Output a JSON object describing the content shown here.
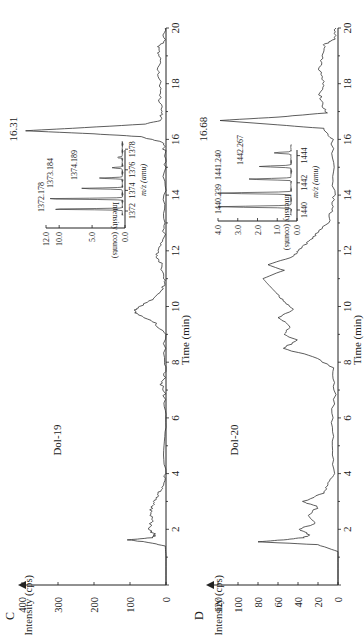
{
  "figure": {
    "orientation": "rotated-90-ccw",
    "panels": [
      {
        "id": "C",
        "panel_label": "C",
        "sample_label": "Dol-19",
        "ylabel": "Intensity (cps)",
        "xlabel": "Time (min)",
        "peak_label": "16.31",
        "y_ticks": [
          "0",
          "100",
          "200",
          "300",
          "400"
        ],
        "x_ticks": [
          "2",
          "4",
          "6",
          "8",
          "10",
          "12",
          "14",
          "16",
          "18",
          "20"
        ],
        "inset": {
          "ylabel": "Intensity (counts)",
          "xlabel": "m/z (amu)",
          "y_ticks": [
            "0.0",
            "5.0",
            "10.0",
            "12.0"
          ],
          "x_ticks": [
            "1372",
            "1374",
            "1376",
            "1378"
          ],
          "peak_labels": [
            "1372.178",
            "1373.184",
            "1374.189"
          ]
        }
      },
      {
        "id": "D",
        "panel_label": "D",
        "sample_label": "Dol-20",
        "ylabel": "Intensity (cps)",
        "xlabel": "Time (min)",
        "peak_label": "16.68",
        "y_ticks": [
          "0",
          "20",
          "40",
          "60",
          "80",
          "100",
          "120"
        ],
        "x_ticks": [
          "2",
          "4",
          "6",
          "8",
          "10",
          "12",
          "14",
          "16",
          "18",
          "20"
        ],
        "inset": {
          "ylabel": "Intensity (counts)",
          "xlabel": "m/z (amu)",
          "y_ticks": [
            "0.0",
            "1.0",
            "2.0",
            "3.0",
            "4.0"
          ],
          "x_ticks": [
            "1440",
            "1442",
            "1444"
          ],
          "peak_labels": [
            "1440.239",
            "1441.240",
            "1442.267"
          ]
        }
      }
    ]
  },
  "chart_data": [
    {
      "type": "line",
      "title": "C — Dol-19 extracted ion chromatogram",
      "xlabel": "Time (min)",
      "ylabel": "Intensity (cps)",
      "xlim": [
        0,
        20
      ],
      "ylim": [
        0,
        400
      ],
      "grid": false,
      "annotations": [
        {
          "text": "16.31",
          "x": 16.31,
          "y": 390
        },
        {
          "text": "Dol-19"
        }
      ],
      "x": [
        0,
        1.0,
        1.4,
        1.55,
        1.62,
        1.7,
        1.8,
        2.0,
        2.3,
        2.6,
        2.9,
        3.1,
        3.3,
        3.5,
        4.0,
        5.0,
        6.0,
        6.8,
        7.2,
        7.5,
        8.0,
        9.0,
        9.4,
        9.7,
        9.85,
        10.0,
        10.3,
        10.7,
        11.0,
        11.5,
        11.8,
        12.0,
        12.4,
        13.0,
        14.0,
        15.0,
        15.6,
        15.9,
        16.1,
        16.2,
        16.31,
        16.4,
        16.55,
        16.7,
        17.0,
        17.5,
        18.0,
        18.5,
        19.0,
        19.3,
        19.5,
        20.0
      ],
      "y": [
        0,
        0,
        2,
        60,
        105,
        40,
        30,
        48,
        38,
        44,
        35,
        30,
        20,
        8,
        3,
        2,
        2,
        4,
        12,
        3,
        2,
        5,
        30,
        78,
        90,
        75,
        30,
        8,
        6,
        12,
        25,
        20,
        6,
        4,
        4,
        3,
        4,
        10,
        70,
        200,
        390,
        260,
        60,
        12,
        14,
        18,
        16,
        20,
        18,
        22,
        6,
        2
      ],
      "inset": {
        "type": "bar",
        "xlabel": "m/z (amu)",
        "ylabel": "Intensity (counts)",
        "xlim": [
          1371,
          1379
        ],
        "ylim": [
          0,
          12
        ],
        "peaks": [
          {
            "mz": 1372.178,
            "intensity": 11.0
          },
          {
            "mz": 1373.184,
            "intensity": 11.8
          },
          {
            "mz": 1374.189,
            "intensity": 6.3
          },
          {
            "mz": 1375.19,
            "intensity": 3.5
          },
          {
            "mz": 1376.2,
            "intensity": 1.6
          },
          {
            "mz": 1377.2,
            "intensity": 0.8
          }
        ]
      }
    },
    {
      "type": "line",
      "title": "D — Dol-20 extracted ion chromatogram",
      "xlabel": "Time (min)",
      "ylabel": "Intensity (cps)",
      "xlim": [
        0,
        20
      ],
      "ylim": [
        0,
        120
      ],
      "grid": false,
      "annotations": [
        {
          "text": "16.68",
          "x": 16.68,
          "y": 118
        },
        {
          "text": "Dol-20"
        }
      ],
      "x": [
        0,
        1.2,
        1.45,
        1.55,
        1.62,
        1.7,
        1.8,
        2.0,
        2.2,
        2.5,
        2.8,
        3.0,
        3.3,
        3.6,
        4.0,
        5.0,
        6.0,
        7.0,
        7.8,
        8.2,
        8.5,
        8.8,
        9.0,
        9.3,
        9.6,
        9.9,
        10.2,
        10.5,
        10.8,
        11.0,
        11.3,
        11.5,
        11.8,
        12.0,
        12.3,
        12.6,
        13.0,
        13.5,
        14.0,
        15.0,
        16.0,
        16.4,
        16.55,
        16.68,
        16.8,
        16.95,
        17.2,
        17.6,
        18.0,
        18.5,
        19.0,
        19.4,
        19.6,
        20.0
      ],
      "y": [
        0,
        0,
        20,
        80,
        55,
        35,
        28,
        40,
        22,
        30,
        20,
        35,
        15,
        10,
        4,
        5,
        6,
        3,
        5,
        25,
        55,
        40,
        55,
        48,
        60,
        45,
        55,
        62,
        70,
        75,
        55,
        70,
        45,
        40,
        30,
        22,
        10,
        6,
        4,
        5,
        6,
        15,
        70,
        118,
        60,
        12,
        15,
        18,
        14,
        18,
        16,
        14,
        4,
        2
      ],
      "inset": {
        "type": "bar",
        "xlabel": "m/z (amu)",
        "ylabel": "Intensity (counts)",
        "xlim": [
          1439,
          1445
        ],
        "ylim": [
          0,
          4
        ],
        "peaks": [
          {
            "mz": 1440.239,
            "intensity": 3.7
          },
          {
            "mz": 1441.24,
            "intensity": 3.9
          },
          {
            "mz": 1442.267,
            "intensity": 2.2
          },
          {
            "mz": 1443.2,
            "intensity": 1.6
          },
          {
            "mz": 1444.2,
            "intensity": 0.9
          }
        ]
      }
    }
  ]
}
